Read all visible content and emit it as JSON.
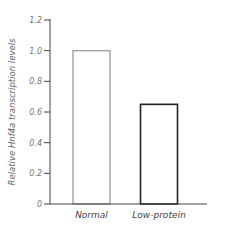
{
  "chart_data": {
    "type": "bar",
    "title": "",
    "xlabel": "",
    "ylabel": "Relative Hnf4a transcription levels",
    "categories": [
      "Normal",
      "Low-protein"
    ],
    "values": [
      1.0,
      0.65
    ],
    "ylim": [
      0,
      1.2
    ],
    "yticks": [
      0,
      0.2,
      0.4,
      0.6,
      0.8,
      1.0,
      1.2
    ],
    "ytick_labels": [
      "0",
      "0.2",
      "0.4",
      "0.6",
      "0.8",
      "1.0",
      "1.2"
    ],
    "bar_colors": [
      "#a0a0a0",
      "#222222"
    ],
    "bar_fill": "#ffffff",
    "grid": false,
    "legend": "none"
  }
}
